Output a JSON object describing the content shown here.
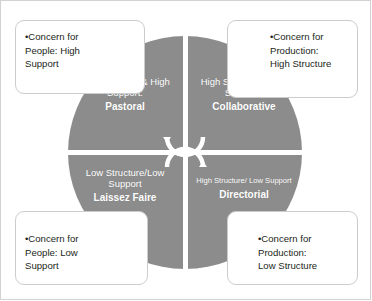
{
  "diagram": {
    "colors": {
      "circle_fill": "#8c8c8c",
      "divider": "#ffffff",
      "quadrant_text": "#ffffff",
      "callout_text": "#231f20",
      "callout_border": "#cccccc",
      "frame_border": "#d2d2d2",
      "background": "#ffffff"
    },
    "center_icon": "cyclical-arrows-icon",
    "quadrants": [
      {
        "id": "top-left",
        "description": "Low Structure\n& High\nSupport:",
        "label": "Pastoral"
      },
      {
        "id": "top-right",
        "description": "High Support\n&  High\nStructure",
        "label": "Collaborative"
      },
      {
        "id": "bottom-left",
        "description": "Low\nStructure/Low\nSupport",
        "label": "Laissez Faire"
      },
      {
        "id": "bottom-right",
        "description": "High Structure/\nLow Support",
        "label": "Directorial"
      }
    ],
    "callouts": [
      {
        "id": "top-left",
        "text": "•Concern for\nPeople: High\nSupport"
      },
      {
        "id": "top-right",
        "text": "•Concern for\nProduction:\nHigh Structure"
      },
      {
        "id": "bottom-left",
        "text": "•Concern for\nPeople: Low\nSupport"
      },
      {
        "id": "bottom-right",
        "text": "•Concern for\nProduction:\nLow Structure"
      }
    ]
  }
}
